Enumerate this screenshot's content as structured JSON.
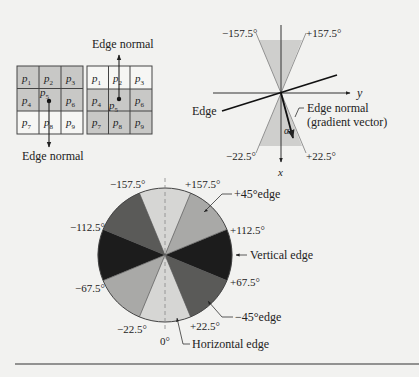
{
  "grids": {
    "left": {
      "cells": [
        "p1",
        "p2",
        "p3",
        "p4",
        "p5",
        "p6",
        "p7",
        "p8",
        "p9"
      ],
      "cell_labels": [
        {
          "base": "p",
          "sub": "1"
        },
        {
          "base": "p",
          "sub": "2"
        },
        {
          "base": "p",
          "sub": "3"
        },
        {
          "base": "p",
          "sub": "4"
        },
        {
          "base": "p",
          "sub": "5"
        },
        {
          "base": "p",
          "sub": "6"
        },
        {
          "base": "p",
          "sub": "7"
        },
        {
          "base": "p",
          "sub": "8"
        },
        {
          "base": "p",
          "sub": "9"
        }
      ],
      "shaded_rows": [
        0,
        1
      ],
      "normal_label": "Edge normal",
      "normal_direction": "down"
    },
    "right": {
      "cell_labels": [
        {
          "base": "p",
          "sub": "1"
        },
        {
          "base": "p",
          "sub": "2"
        },
        {
          "base": "p",
          "sub": "3"
        },
        {
          "base": "p",
          "sub": "4"
        },
        {
          "base": "p",
          "sub": "5"
        },
        {
          "base": "p",
          "sub": "6"
        },
        {
          "base": "p",
          "sub": "7"
        },
        {
          "base": "p",
          "sub": "8"
        },
        {
          "base": "p",
          "sub": "9"
        }
      ],
      "shaded_rows": [
        1,
        2
      ],
      "normal_label": "Edge normal",
      "normal_direction": "up"
    }
  },
  "axes_diagram": {
    "x_axis_label": "x",
    "y_axis_label": "y",
    "edge_label": "Edge",
    "normal_label_line1": "Edge normal",
    "normal_label_line2": "(gradient vector)",
    "alpha_label": "α",
    "angle_labels": {
      "top_left": "−157.5°",
      "top_right": "+157.5°",
      "bottom_left": "−22.5°",
      "bottom_right": "+22.5°"
    }
  },
  "circle_diagram": {
    "angle_labels": {
      "m157": "−157.5°",
      "p157": "+157.5°",
      "m112": "−112.5°",
      "p112": "+112.5°",
      "m67": "−67.5°",
      "p67": "+67.5°",
      "m22": "−22.5°",
      "p22": "+22.5°",
      "zero": "0°"
    },
    "edge_labels": {
      "plus45": "+45°edge",
      "vertical": "Vertical edge",
      "minus45": "−45°edge",
      "horizontal": "Horizontal edge"
    },
    "colors": {
      "horizontal": "#d6d6d4",
      "plus45": "#a9a9a7",
      "vertical": "#1c1c1c",
      "minus45": "#5a5a58"
    }
  }
}
